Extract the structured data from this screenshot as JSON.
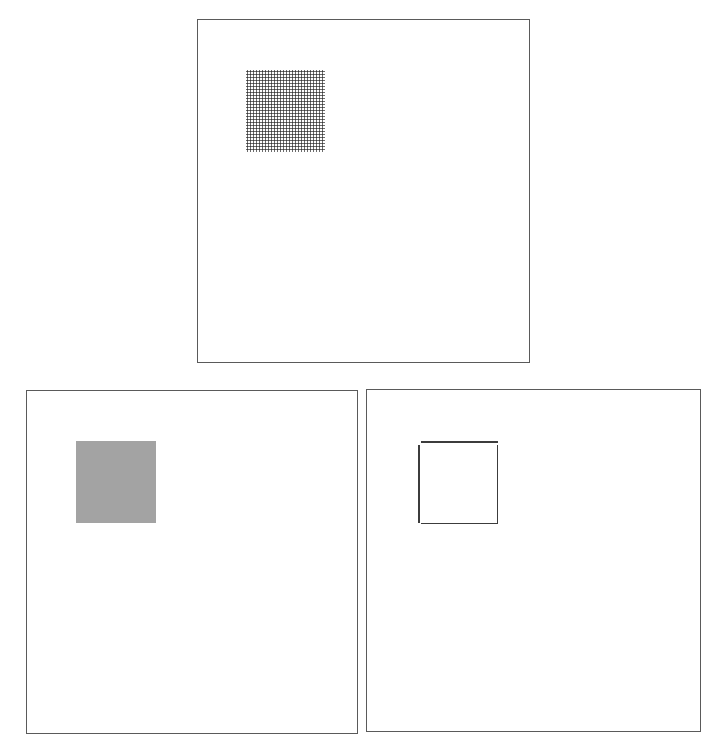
{
  "figure": {
    "panels": [
      {
        "id": "top",
        "position": "top-center",
        "content": "dot-grid-square",
        "fill": "halftone dots",
        "dot_color": "#3a3a3a"
      },
      {
        "id": "bottom-left",
        "position": "bottom-left",
        "content": "solid-gray-square",
        "fill_color": "#a3a3a3"
      },
      {
        "id": "bottom-right",
        "position": "bottom-right",
        "content": "outlined-square",
        "stroke_color": "#3c3c3c"
      }
    ],
    "border_color": "#5a5a5a",
    "background": "#ffffff"
  }
}
